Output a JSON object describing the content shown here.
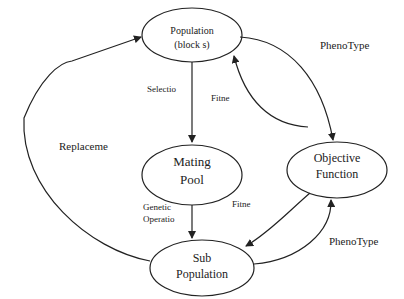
{
  "diagram": {
    "nodes": {
      "population": {
        "line1": "Population",
        "line2": "(block s)"
      },
      "mating_pool": {
        "line1": "Mating",
        "line2": "Pool"
      },
      "objective_function": {
        "line1": "Objective",
        "line2": "Function"
      },
      "sub_population": {
        "line1": "Sub",
        "line2": "Population"
      }
    },
    "edges": {
      "selection": "Selectio",
      "fitness_top": "Fitne",
      "phenotype_top": "PhenoType",
      "genetic_ops_line1": "Genetic",
      "genetic_ops_line2": "Operatio",
      "fitness_bottom": "Fitne",
      "phenotype_bottom": "PhenoType",
      "replacement": "Replaceme"
    },
    "colors": {
      "stroke": "#222222",
      "background": "#ffffff"
    }
  }
}
